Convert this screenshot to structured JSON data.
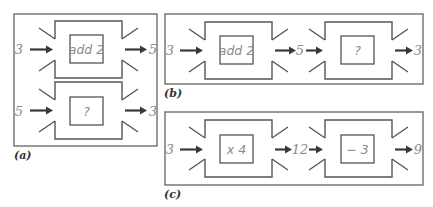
{
  "diagram": {
    "type": "function-machines",
    "colors": {
      "frame": "#6e6e6e",
      "machine": "#555555",
      "arrow": "#3a3a3a",
      "text": "#8a8a8a",
      "label": "#333333"
    },
    "panels": [
      {
        "label": "(a)",
        "rows": [
          {
            "input": "3",
            "operation": "add 2",
            "output": "5"
          },
          {
            "input": "5",
            "operation": "?",
            "output": "3"
          }
        ]
      },
      {
        "label": "(b)",
        "chain": {
          "input": "3",
          "op1": "add 2",
          "middle": "5",
          "op2": "?",
          "output": "3"
        }
      },
      {
        "label": "(c)",
        "chain": {
          "input": "3",
          "op1": "x 4",
          "middle": "12",
          "op2": "− 3",
          "output": "9"
        }
      }
    ]
  }
}
